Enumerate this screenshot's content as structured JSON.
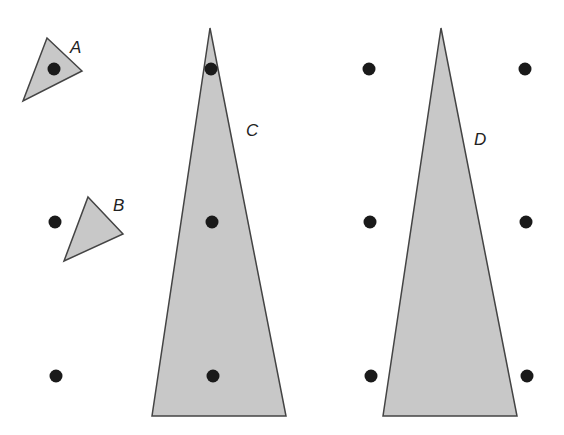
{
  "figure": {
    "background": "#ffffff",
    "fill_color": "#c8c8c8",
    "stroke_color": "#444444",
    "dot_color": "#1a1a1a",
    "shapes": [
      {
        "id": "A",
        "label": "A",
        "points": "47,38 82,71 23,101",
        "label_pos": [
          70,
          53
        ]
      },
      {
        "id": "B",
        "label": "B",
        "points": "88,197 123,234 64,261",
        "label_pos": [
          113,
          211
        ]
      },
      {
        "id": "C",
        "label": "C",
        "points": "210,28 286,416 152,416",
        "label_pos": [
          246,
          136
        ]
      },
      {
        "id": "D",
        "label": "D",
        "points": "441,28 517,416 383,416",
        "label_pos": [
          474,
          145
        ]
      }
    ],
    "dots": [
      {
        "x": 54,
        "y": 69
      },
      {
        "x": 211,
        "y": 69
      },
      {
        "x": 369,
        "y": 69
      },
      {
        "x": 525,
        "y": 69
      },
      {
        "x": 55,
        "y": 222
      },
      {
        "x": 212,
        "y": 222
      },
      {
        "x": 370,
        "y": 222
      },
      {
        "x": 526,
        "y": 222
      },
      {
        "x": 56,
        "y": 376
      },
      {
        "x": 213,
        "y": 376
      },
      {
        "x": 371,
        "y": 376
      },
      {
        "x": 527,
        "y": 376
      }
    ]
  }
}
